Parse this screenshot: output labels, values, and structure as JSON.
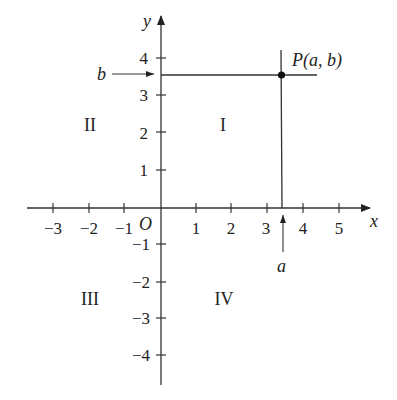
{
  "diagram": {
    "axes": {
      "x_label": "x",
      "y_label": "y",
      "origin_label": "O",
      "x_ticks": [
        -3,
        -2,
        -1,
        1,
        2,
        3,
        4,
        5
      ],
      "y_ticks": [
        4,
        3,
        2,
        1,
        -1,
        -2,
        -3,
        -4
      ],
      "x_tick_labels": [
        "−3",
        "−2",
        "−1",
        "1",
        "2",
        "3",
        "4",
        "5"
      ],
      "y_tick_labels": [
        "4",
        "3",
        "2",
        "1",
        "−1",
        "−2",
        "−3",
        "−4"
      ]
    },
    "quadrants": {
      "I": "I",
      "II": "II",
      "III": "III",
      "IV": "IV"
    },
    "point": {
      "label": "P(a, b)",
      "a_approx": 3.4,
      "b_approx": 3.6
    },
    "markers": {
      "a_label": "a",
      "b_label": "b"
    },
    "colors": {
      "ink": "#222222",
      "background": "#ffffff"
    }
  }
}
